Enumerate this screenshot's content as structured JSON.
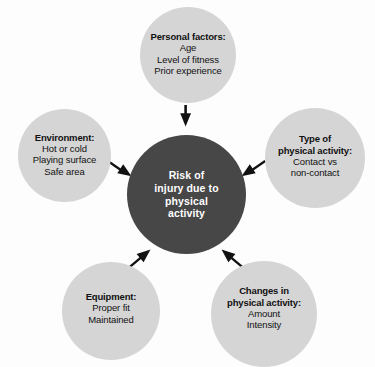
{
  "diagram": {
    "type": "radial-hub-and-spoke",
    "background_color": "#fdfdfd",
    "hub_color": "#474747",
    "satellite_color": "#d5d5d5",
    "hub_text_color": "#ffffff",
    "satellite_text_color": "#111111",
    "arrow_color": "#111111",
    "center": {
      "id": "risk-of-injury",
      "title": "Risk of\ninjury due to\nphysical\nactivity",
      "lines": []
    },
    "nodes": [
      {
        "id": "personal-factors",
        "position": "top",
        "title": "Personal factors:",
        "lines": [
          "Age",
          "Level of fitness",
          "Prior experience"
        ]
      },
      {
        "id": "environment",
        "position": "left",
        "title": "Environment:",
        "lines": [
          "Hot or cold",
          "Playing surface",
          "Safe area"
        ]
      },
      {
        "id": "type-of-physical-activity",
        "position": "right",
        "title": "Type of\nphysical activity:",
        "lines": [
          "Contact vs",
          "non-contact"
        ]
      },
      {
        "id": "equipment",
        "position": "bottom-left",
        "title": "Equipment:",
        "lines": [
          "Proper fit",
          "Maintained"
        ]
      },
      {
        "id": "changes-in-physical-activity",
        "position": "bottom-right",
        "title": "Changes in\nphysical activity:",
        "lines": [
          "Amount",
          "Intensity"
        ]
      }
    ],
    "arrows": [
      {
        "id": "arrow-personal-to-center",
        "from": "personal-factors",
        "to": "risk-of-injury",
        "direction": "down"
      },
      {
        "id": "arrow-environment-to-center",
        "from": "environment",
        "to": "risk-of-injury",
        "direction": "down-right"
      },
      {
        "id": "arrow-type-to-center",
        "from": "type-of-physical-activity",
        "to": "risk-of-injury",
        "direction": "down-left"
      },
      {
        "id": "arrow-equipment-to-center",
        "from": "equipment",
        "to": "risk-of-injury",
        "direction": "up-right"
      },
      {
        "id": "arrow-changes-to-center",
        "from": "changes-in-physical-activity",
        "to": "risk-of-injury",
        "direction": "up-left"
      }
    ]
  }
}
